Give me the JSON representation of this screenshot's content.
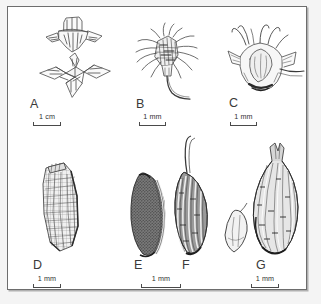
{
  "figure": {
    "type": "botanical-line-drawing-plate",
    "background_color": "#ffffff",
    "ink_color": "#3a3a3a",
    "frame_color": "#6d6d6d",
    "panel_count": 7
  },
  "panels": [
    {
      "id": "A",
      "label": "A",
      "subject": "four-lobed calyx, two views",
      "scale": {
        "label": "1 cm",
        "value": 1,
        "unit": "cm"
      }
    },
    {
      "id": "B",
      "label": "B",
      "subject": "bristly floret with curved awn",
      "scale": {
        "label": "1 mm",
        "value": 1,
        "unit": "mm"
      }
    },
    {
      "id": "C",
      "label": "C",
      "subject": "seed enclosed in hooked bracts",
      "scale": {
        "label": "1 mm",
        "value": 1,
        "unit": "mm"
      }
    },
    {
      "id": "D",
      "label": "D",
      "subject": "elongate reticulate seed",
      "scale": {
        "label": "1 mm",
        "value": 1,
        "unit": "mm"
      }
    },
    {
      "id": "E",
      "label": "E",
      "subject": "dark stippled seed",
      "scale": {
        "label": "1 mm",
        "value": 1,
        "unit": "mm"
      }
    },
    {
      "id": "F",
      "label": "F",
      "subject": "ribbed seed with long awn",
      "scale": {
        "label": "1 mm",
        "value": 1,
        "unit": "mm"
      }
    },
    {
      "id": "G",
      "label": "G",
      "subject": "pale seed and ribbed beaked husk",
      "scale": {
        "label": "1 mm",
        "value": 1,
        "unit": "mm"
      }
    }
  ],
  "scalebars": {
    "a": "1 cm",
    "b": "1 mm",
    "c": "1 mm",
    "d": "1 mm",
    "ef": "1 mm",
    "g": "1 mm"
  }
}
